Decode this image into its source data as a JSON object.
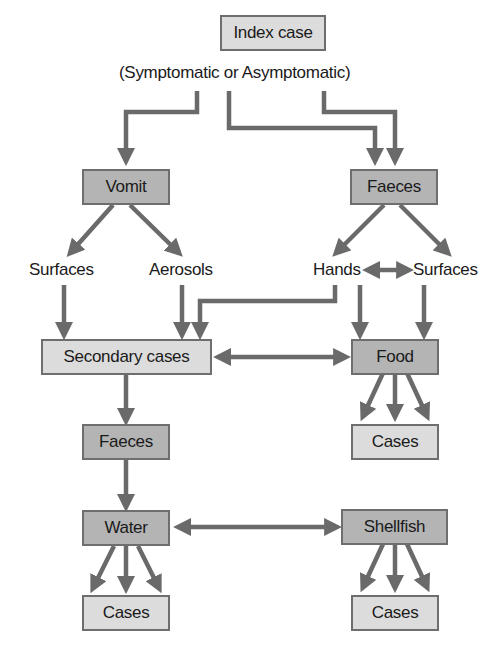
{
  "diagram": {
    "type": "flowchart",
    "colors": {
      "light_box": "#dcdcdc",
      "dark_box": "#b4b4b4",
      "border": "#6e6e6e",
      "arrow": "#6a6a6a"
    },
    "nodes": {
      "index_case": "Index case",
      "index_subtitle": "(Symptomatic or Asymptomatic)",
      "vomit": "Vomit",
      "faeces_top": "Faeces",
      "surfaces_left": "Surfaces",
      "aerosols": "Aerosols",
      "hands": "Hands",
      "surfaces_right": "Surfaces",
      "secondary_cases": "Secondary cases",
      "food": "Food",
      "food_cases": "Cases",
      "faeces_bottom": "Faeces",
      "water": "Water",
      "shellfish": "Shellfish",
      "water_cases": "Cases",
      "shellfish_cases": "Cases"
    },
    "edges": [
      [
        "index_case",
        "vomit"
      ],
      [
        "index_case",
        "faeces_top"
      ],
      [
        "index_case",
        "faeces_top"
      ],
      [
        "vomit",
        "surfaces_left"
      ],
      [
        "vomit",
        "aerosols"
      ],
      [
        "faeces_top",
        "hands"
      ],
      [
        "faeces_top",
        "surfaces_right"
      ],
      [
        "hands",
        "surfaces_right",
        "bidirectional"
      ],
      [
        "surfaces_left",
        "secondary_cases"
      ],
      [
        "aerosols",
        "secondary_cases"
      ],
      [
        "hands",
        "secondary_cases"
      ],
      [
        "hands",
        "food"
      ],
      [
        "surfaces_right",
        "food"
      ],
      [
        "secondary_cases",
        "food",
        "bidirectional"
      ],
      [
        "food",
        "food_cases",
        "x3"
      ],
      [
        "secondary_cases",
        "faeces_bottom"
      ],
      [
        "faeces_bottom",
        "water"
      ],
      [
        "water",
        "shellfish",
        "bidirectional"
      ],
      [
        "water",
        "water_cases",
        "x3"
      ],
      [
        "shellfish",
        "shellfish_cases",
        "x3"
      ]
    ]
  }
}
